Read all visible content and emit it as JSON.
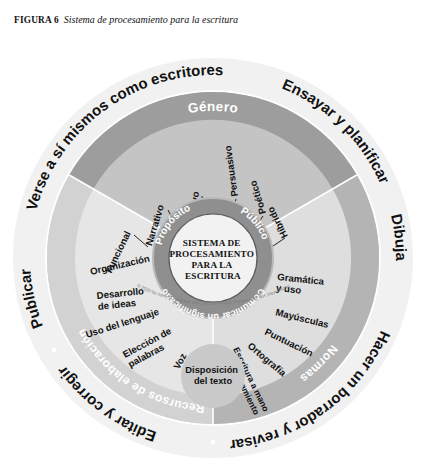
{
  "caption": {
    "figure_label": "FIGURA 6",
    "title": "Sistema de procesamiento para la escritura"
  },
  "diagram": {
    "type": "concentric-wheel",
    "center": {
      "line1": "SISTEMA DE",
      "line2": "PROCESAMIENTO",
      "line3": "PARA LA",
      "line4": "ESCRITURA"
    },
    "inner_ring": {
      "left": "Propósito",
      "right": "Público",
      "bottom": "Comunicar un significado"
    },
    "band_labels": {
      "genero": "Género",
      "normas": "Normas",
      "recursos": "Recursos de elaboración"
    },
    "genre_spokes": [
      "Funcional",
      "Narrativo",
      "Informativo",
      "Persuasivo",
      "Poético",
      "Híbrido"
    ],
    "craft_spokes": [
      "Organización",
      "Desarrollo\nde ideas",
      "Uso del lenguaje",
      "Elección de\npalabras",
      "Voz"
    ],
    "conventions_spokes": [
      "Gramática\ny uso",
      "Mayúsculas",
      "Puntuación",
      "Ortografía",
      "Escritura a mano\ny procesamiento\nde textos"
    ],
    "bottom_bubble": {
      "line1": "Disposición",
      "line2": "del texto"
    },
    "outer_ring": [
      "Verse a sí mismos como escritores",
      "Ensayar y planificar",
      "Dibujar",
      "Hacer un borrador y revisar",
      "Editar y corregir",
      "Publicar"
    ],
    "credit": "© 2020 by Irene C. Fountas and Gay Su Pinnell. Portsmouth, NH: Heinemann.",
    "colors": {
      "outer_ring_fill": "#f1f1f1",
      "band_dark": "#9d9d9d",
      "genre_fill": "#c4c4c4",
      "craft_fill": "#e4e4e4",
      "conventions_fill": "#dcdcdc",
      "inner_ring": "#8f8f8f",
      "core_fill": "#f2f2f2",
      "bubble_fill": "#c9c9c9",
      "text_dark": "#111111",
      "text_light": "#ffffff"
    }
  }
}
